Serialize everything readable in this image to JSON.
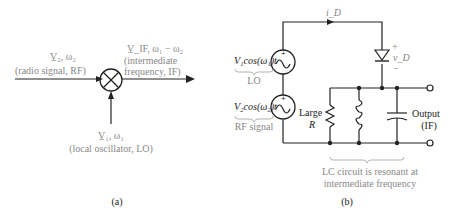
{
  "panel_a": {
    "caption": "(a)",
    "rf_input": {
      "symbol": "V̲₂, ω₂",
      "desc": "(radio signal, RF)"
    },
    "if_output": {
      "symbol": "V̲_IF, ω₁ − ω₂",
      "desc_line1": "(intermediate",
      "desc_line2": "frequency, IF)"
    },
    "lo_input": {
      "symbol": "V̲₁, ω₁",
      "desc": "(local oscillator, LO)"
    },
    "mixer_icon": "circle-x-mixer"
  },
  "panel_b": {
    "caption": "(b)",
    "current_label": "i_D",
    "diode_voltage_label": "v_D",
    "diode_plus": "+",
    "diode_minus": "−",
    "source1": {
      "expr": "V₁cos(ω₁)t",
      "label": "LO"
    },
    "source2": {
      "expr": "V₂cos(ω₂)t",
      "label": "RF signal"
    },
    "resistor_label_line1": "Large",
    "resistor_label_line2": "R",
    "output_label_line1": "Output",
    "output_label_line2": "(IF)",
    "lc_note_line1": "LC circuit is resonant at",
    "lc_note_line2": "intermediate frequency"
  }
}
